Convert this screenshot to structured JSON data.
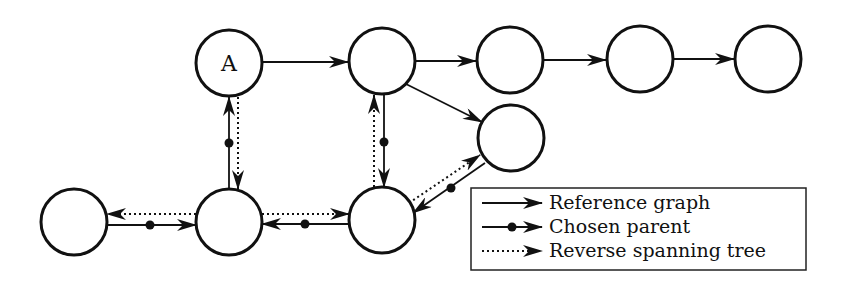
{
  "diagram": {
    "title": "",
    "nodes": [
      {
        "id": "A",
        "label": "A",
        "x": 229,
        "y": 63
      },
      {
        "id": "B",
        "label": "",
        "x": 382,
        "y": 61
      },
      {
        "id": "C",
        "label": "",
        "x": 510,
        "y": 60
      },
      {
        "id": "D",
        "label": "",
        "x": 640,
        "y": 59
      },
      {
        "id": "E",
        "label": "",
        "x": 768,
        "y": 59
      },
      {
        "id": "P",
        "label": "",
        "x": 511,
        "y": 138
      },
      {
        "id": "L",
        "label": "",
        "x": 74,
        "y": 222
      },
      {
        "id": "M",
        "label": "",
        "x": 229,
        "y": 222
      },
      {
        "id": "N",
        "label": "",
        "x": 382,
        "y": 220
      }
    ],
    "edges": {
      "reference_graph": [
        {
          "from": "A",
          "to": "B"
        },
        {
          "from": "B",
          "to": "C"
        },
        {
          "from": "C",
          "to": "D"
        },
        {
          "from": "D",
          "to": "E"
        },
        {
          "from": "B",
          "to": "P"
        }
      ],
      "chosen_parent": [
        {
          "from": "M",
          "to": "A"
        },
        {
          "from": "B",
          "to": "N"
        },
        {
          "from": "L",
          "to": "M"
        },
        {
          "from": "N",
          "to": "M"
        },
        {
          "from": "P",
          "to": "N"
        }
      ],
      "reverse_spanning_tree": [
        {
          "from": "A",
          "to": "M"
        },
        {
          "from": "N",
          "to": "B"
        },
        {
          "from": "M",
          "to": "L"
        },
        {
          "from": "M",
          "to": "N"
        },
        {
          "from": "N",
          "to": "P"
        }
      ]
    },
    "legend": {
      "items": [
        {
          "style": "solid-arrow",
          "label": "Reference graph"
        },
        {
          "style": "dot-arrow",
          "label": "Chosen parent"
        },
        {
          "style": "dotted-arrow",
          "label": "Reverse spanning tree"
        }
      ]
    }
  }
}
